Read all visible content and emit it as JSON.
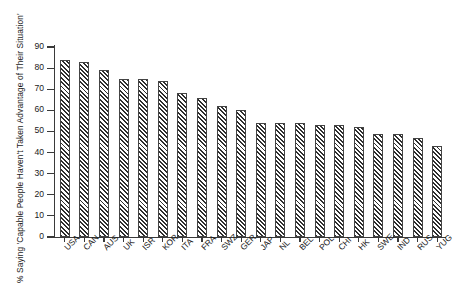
{
  "chart_data": {
    "type": "bar",
    "title": "",
    "xlabel": "",
    "ylabel": "% Saying 'Capable People Haven't Taken Advantage of Their Situation'",
    "ylim": [
      0,
      90
    ],
    "yticks": [
      0,
      10,
      20,
      30,
      40,
      50,
      60,
      70,
      80,
      90
    ],
    "grid": false,
    "legend": false,
    "bar_style": "diagonal-hatch",
    "categories": [
      "USA",
      "CAN",
      "AUS",
      "UK",
      "ISR",
      "KOR",
      "ITA",
      "FRA",
      "SWZ",
      "GER",
      "JAP",
      "NL",
      "BEL",
      "POL",
      "CHI",
      "HK",
      "SWE",
      "IND",
      "RUS",
      "YUG"
    ],
    "values": [
      84,
      83,
      79,
      75,
      75,
      74,
      68,
      66,
      62,
      60,
      54,
      54,
      54,
      53,
      53,
      52,
      49,
      49,
      47,
      43
    ]
  }
}
